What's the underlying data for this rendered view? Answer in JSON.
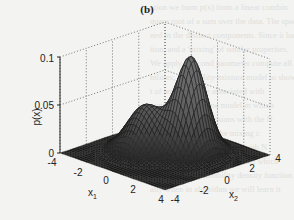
{
  "figure": {
    "panel_label": "(b)"
  },
  "chart_data": {
    "type": "surface3d",
    "title": "(b)",
    "xlabel": "x1",
    "ylabel": "x2",
    "zlabel": "p(x)",
    "x_ticks": [
      "-4",
      "-2",
      "0",
      "2",
      "4"
    ],
    "y_ticks": [
      "-4",
      "-2",
      "0",
      "2",
      "4"
    ],
    "z_ticks": [
      "0",
      "0.05",
      "0.1"
    ],
    "xlim": [
      -4,
      4
    ],
    "ylim": [
      -4,
      4
    ],
    "zlim": [
      0,
      0.1
    ],
    "grid": true,
    "components": [
      {
        "mean": [
          -1.0,
          -0.5
        ],
        "peak_height": 0.048,
        "sigma": [
          1.0,
          1.0
        ]
      },
      {
        "mean": [
          1.0,
          1.0
        ],
        "peak_height": 0.1,
        "sigma": [
          0.8,
          0.9
        ]
      }
    ],
    "peaks": [
      {
        "label": "minor peak",
        "x1": -1.0,
        "x2": -0.5,
        "p": 0.048
      },
      {
        "label": "major peak",
        "x1": 1.0,
        "x2": 1.0,
        "p": 0.1
      }
    ]
  },
  "axes": {
    "z_label": "p(x)",
    "x1_label": "x",
    "x1_sub": "1",
    "x2_label": "x",
    "x2_sub": "2",
    "z_ticks": [
      "0",
      "0.05",
      "0.1"
    ],
    "x1_ticks": [
      "-4",
      "-2",
      "0",
      "2",
      "4"
    ],
    "x2_ticks": [
      "-4",
      "-2",
      "0",
      "2",
      "4"
    ]
  },
  "background_text": [
    "ation we form p(x) from a linear combin",
    "quare root of a sum over the data. The spaci",
    "ned in the distinct components. Since it has",
    "tion, and a 'mixing' of similar properties.",
    "We apply a second parameter compute all the",
    "bilities, probability-mixture model to show",
    "t of terms that are associated with",
    "nonzero of the same model in which",
    "mixture of the Gaussians with the N",
    "and that the sum of the mixing c",
    "the sum of the components with N",
    "ments of the component model which",
    "change of the probability density function",
    "ally when in algorithm we will learn it"
  ]
}
